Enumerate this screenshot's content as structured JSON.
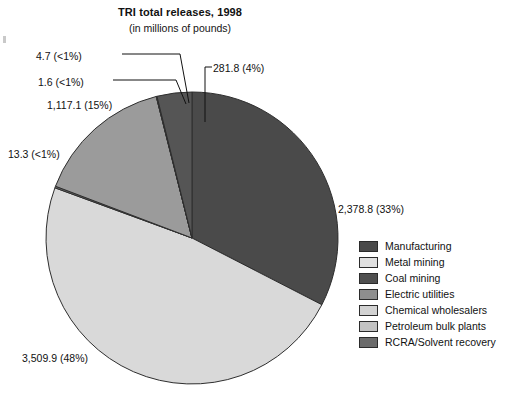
{
  "chart": {
    "title": "TRI total releases, 1998",
    "subtitle": "(in millions of pounds)"
  },
  "chart_data": {
    "type": "pie",
    "title": "TRI total releases, 1998",
    "subtitle": "(in millions of pounds)",
    "units": "millions of pounds",
    "total": 7303.2,
    "legend_position": "right",
    "start_angle_deg": 0,
    "direction": "clockwise",
    "categories": [
      "Manufacturing",
      "Metal mining",
      "Coal mining",
      "Electric utilities",
      "Chemical wholesalers",
      "Petroleum bulk plants",
      "RCRA/Solvent recovery"
    ],
    "values": [
      2378.8,
      3509.9,
      281.8,
      1117.1,
      1.6,
      4.7,
      13.3
    ],
    "percents": [
      "33%",
      "48%",
      "4%",
      "15%",
      "<1%",
      "<1%",
      "<1%"
    ],
    "colors": [
      "#4a4a4a",
      "#d9d9d9",
      "#555555",
      "#9b9b9b",
      "#cfcfcf",
      "#c4c4c4",
      "#6e6e6e"
    ],
    "slices": [
      {
        "name": "Manufacturing",
        "value": 2378.8,
        "percent": "33%",
        "data_label": "2,378.8 (33%)",
        "color": "#4a4a4a"
      },
      {
        "name": "Metal mining",
        "value": 3509.9,
        "percent": "48%",
        "data_label": "3,509.9 (48%)",
        "color": "#d9d9d9"
      },
      {
        "name": "Coal mining",
        "value": 281.8,
        "percent": "4%",
        "data_label": "281.8 (4%)",
        "color": "#555555"
      },
      {
        "name": "Electric utilities",
        "value": 1117.1,
        "percent": "15%",
        "data_label": "1,117.1 (15%)",
        "color": "#9b9b9b"
      },
      {
        "name": "Chemical wholesalers",
        "value": 1.6,
        "percent": "<1%",
        "data_label": "1.6 (<1%)",
        "color": "#cfcfcf"
      },
      {
        "name": "Petroleum bulk plants",
        "value": 4.7,
        "percent": "<1%",
        "data_label": "4.7 (<1%)",
        "color": "#c4c4c4"
      },
      {
        "name": "RCRA/Solvent recovery",
        "value": 13.3,
        "percent": "<1%",
        "data_label": "13.3 (<1%)",
        "color": "#6e6e6e"
      }
    ]
  },
  "legend": {
    "items": [
      {
        "label": "Manufacturing",
        "color": "#4a4a4a"
      },
      {
        "label": "Metal mining",
        "color": "#e0e0e0"
      },
      {
        "label": "Coal mining",
        "color": "#4f4f4f"
      },
      {
        "label": "Electric utilities",
        "color": "#8e8e8e"
      },
      {
        "label": "Chemical wholesalers",
        "color": "#d2d2d2"
      },
      {
        "label": "Petroleum bulk plants",
        "color": "#c2c2c2"
      },
      {
        "label": "RCRA/Solvent recovery",
        "color": "#6b6b6b"
      }
    ]
  }
}
